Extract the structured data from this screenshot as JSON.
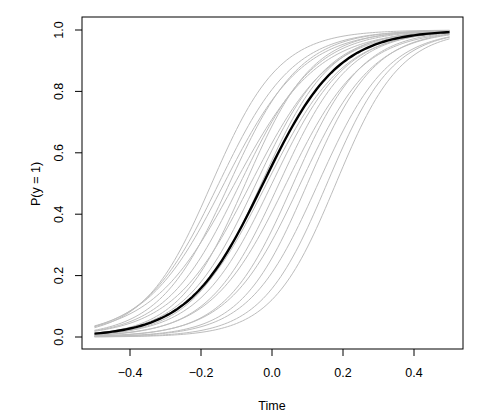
{
  "chart_data": {
    "type": "line",
    "title": "",
    "xlabel": "Time",
    "ylabel": "P(y = 1)",
    "xlim": [
      -0.5,
      0.5
    ],
    "ylim": [
      0.0,
      1.0
    ],
    "grid": false,
    "legend": null,
    "x_ticks": [
      -0.4,
      -0.2,
      0.0,
      0.2,
      0.4
    ],
    "x_tick_labels": [
      "−0.4",
      "−0.2",
      "0.0",
      "0.2",
      "0.4"
    ],
    "y_ticks": [
      0.0,
      0.2,
      0.4,
      0.6,
      0.8,
      1.0
    ],
    "y_tick_labels": [
      "0.0",
      "0.2",
      "0.4",
      "0.6",
      "0.8",
      "1.0"
    ],
    "curve_form": "logistic: P = 1 / (1 + exp(-slope * (Time - center)))",
    "x_range_of_curves": [
      -0.5,
      0.5
    ],
    "highlight_series": {
      "name": "mean curve",
      "color": "#000000",
      "line_width": 2.4,
      "center": -0.025,
      "slope": 9.5
    },
    "series": [
      {
        "name": "draw-1",
        "center": -0.17,
        "slope": 10.5
      },
      {
        "name": "draw-2",
        "center": -0.15,
        "slope": 9.5
      },
      {
        "name": "draw-3",
        "center": -0.135,
        "slope": 9.0
      },
      {
        "name": "draw-4",
        "center": -0.12,
        "slope": 10.0
      },
      {
        "name": "draw-5",
        "center": -0.105,
        "slope": 8.5
      },
      {
        "name": "draw-6",
        "center": -0.09,
        "slope": 9.5
      },
      {
        "name": "draw-7",
        "center": -0.075,
        "slope": 10.5
      },
      {
        "name": "draw-8",
        "center": -0.06,
        "slope": 9.0
      },
      {
        "name": "draw-9",
        "center": -0.045,
        "slope": 9.8
      },
      {
        "name": "draw-10",
        "center": -0.03,
        "slope": 10.2
      },
      {
        "name": "draw-11",
        "center": -0.015,
        "slope": 9.2
      },
      {
        "name": "draw-12",
        "center": 0.0,
        "slope": 9.6
      },
      {
        "name": "draw-13",
        "center": 0.02,
        "slope": 10.0
      },
      {
        "name": "draw-14",
        "center": 0.04,
        "slope": 9.4
      },
      {
        "name": "draw-15",
        "center": 0.06,
        "slope": 10.4
      },
      {
        "name": "draw-16",
        "center": 0.08,
        "slope": 9.8
      },
      {
        "name": "draw-17",
        "center": 0.1,
        "slope": 10.6
      },
      {
        "name": "draw-18",
        "center": 0.13,
        "slope": 10.2
      },
      {
        "name": "draw-19",
        "center": 0.155,
        "slope": 10.8
      },
      {
        "name": "draw-20",
        "center": 0.18,
        "slope": 11.0
      }
    ],
    "series_color": "#bdbdbd",
    "series_line_width": 1.0
  }
}
